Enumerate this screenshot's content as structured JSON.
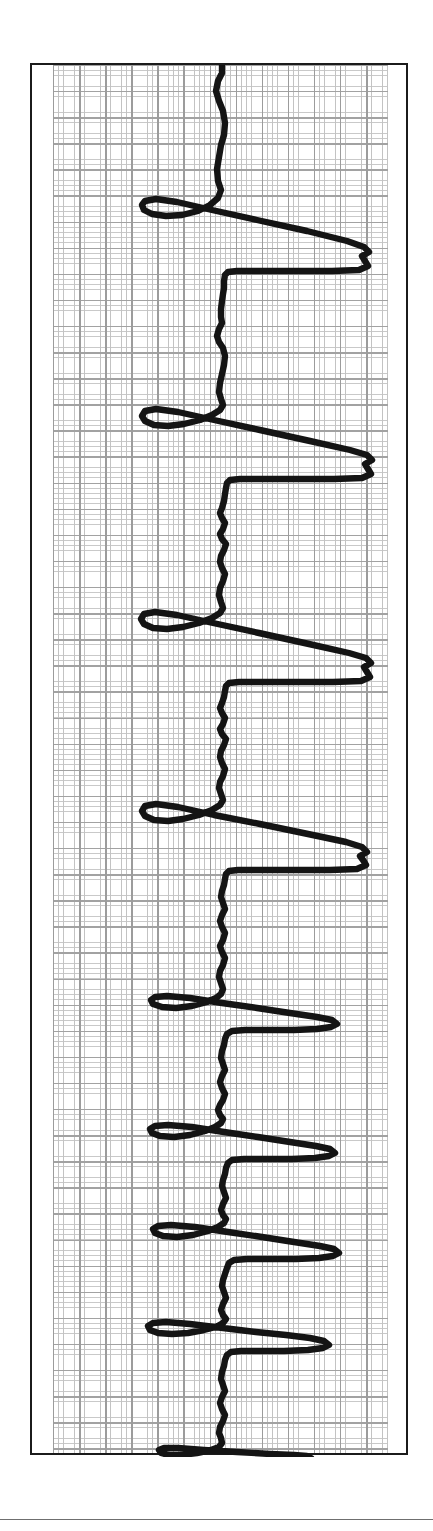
{
  "document": {
    "kind": "ecg-rhythm-strip",
    "orientation": "rotated-90-trace-runs-vertically",
    "frame_color": "#1b1b1b",
    "trace_color": "#141414",
    "grid_fine_color": "#c6c6c6",
    "grid_bold_color": "#9f9f9f",
    "paper_color": "#ffffff"
  },
  "chart_data": {
    "type": "line",
    "title": "",
    "subtitle": "",
    "xlabel": "",
    "ylabel": "",
    "grid": true,
    "legend": null,
    "annotations": [],
    "axis": {
      "time_axis": "vertical-downward",
      "amplitude_axis": "horizontal",
      "amplitude_range_units": [
        -1.55,
        2.85
      ],
      "time_range_units": [
        0,
        53.4
      ],
      "small_square_px": 5.22,
      "bold_square_every": 5,
      "baseline_amplitude": 0.0
    },
    "beats": [
      {
        "index": 1,
        "time": 3.1,
        "type": "wide-complex",
        "s_amplitude": -1.55,
        "r_amplitude": 2.82,
        "notched_peak": true
      },
      {
        "index": 2,
        "time": 9.5,
        "type": "wide-complex",
        "s_amplitude": -1.5,
        "r_amplitude": 2.85,
        "notched_peak": true
      },
      {
        "index": 3,
        "time": 16.0,
        "type": "wide-complex",
        "s_amplitude": -1.52,
        "r_amplitude": 2.78,
        "notched_peak": true
      },
      {
        "index": 4,
        "time": 22.3,
        "type": "wide-complex",
        "s_amplitude": -1.48,
        "r_amplitude": 2.8,
        "notched_peak": true
      },
      {
        "index": 5,
        "time": 26.6,
        "type": "narrow-spike",
        "s_amplitude": -1.1,
        "r_amplitude": 1.5,
        "notched_peak": false
      },
      {
        "index": 6,
        "time": 30.3,
        "type": "narrow-spike",
        "s_amplitude": -1.12,
        "r_amplitude": 1.45,
        "notched_peak": false
      },
      {
        "index": 7,
        "time": 34.0,
        "type": "narrow-spike",
        "s_amplitude": -1.15,
        "r_amplitude": 1.4,
        "notched_peak": false
      },
      {
        "index": 8,
        "time": 38.6,
        "type": "narrow-spike",
        "s_amplitude": -1.18,
        "r_amplitude": 1.52,
        "notched_peak": false
      },
      {
        "index": 9,
        "time": 42.0,
        "type": "narrow-spike",
        "s_amplitude": -1.2,
        "r_amplitude": 1.48,
        "notched_peak": false
      },
      {
        "index": 10,
        "time": 45.0,
        "type": "narrow-spike",
        "s_amplitude": -1.22,
        "r_amplitude": 1.42,
        "notched_peak": false
      },
      {
        "index": 11,
        "time": 46.8,
        "type": "narrow-spike",
        "s_amplitude": -1.05,
        "r_amplitude": 1.1,
        "notched_peak": false
      },
      {
        "index": 12,
        "time": 52.0,
        "type": "narrow-spike",
        "s_amplitude": -1.1,
        "r_amplitude": 1.05,
        "notched_peak": false
      }
    ],
    "trace_path": "M 190 0 L 190 8 L 186 16 L 184 26 L 187 36 L 191 46 L 193 58 L 192 70 L 189 80 L 187 92 L 185 104 L 186 116 L 189 125 L 186 133 L 178 140 L 166 146 L 150 150 L 134 151 L 120 149 L 112 145 L 110 140 L 113 136 L 124 134 L 145 137 L 180 145 L 225 155 L 275 166 L 315 176 L 332 182 L 337 187 L 330 191 L 333 196 L 336 201 L 327 205 L 300 206 L 260 206 L 225 206 L 205 206 L 196 207 L 193 210 L 192 216 L 192 223 L 191 229 L 190 236 L 189 244 L 189 252 L 190 258 L 187 264 L 185 271 L 187 277 L 191 283 L 193 291 L 192 300 L 190 309 L 188 318 L 187 327 L 189 334 L 191 340 L 188 345 L 180 350 L 168 355 L 152 359 L 136 361 L 122 360 L 113 356 L 110 351 L 113 346 L 124 344 L 146 347 L 182 355 L 228 365 L 278 376 L 318 385 L 335 390 L 340 395 L 333 399 L 336 404 L 339 409 L 330 413 L 302 414 L 262 414 L 228 414 L 208 414 L 198 415 L 195 418 L 194 423 L 193 429 L 192 436 L 190 443 L 188 448 L 190 453 L 193 458 L 191 464 L 188 469 L 190 474 L 194 479 L 192 485 L 189 491 L 188 497 L 190 503 L 193 509 L 191 516 L 188 523 L 187 530 L 189 537 L 191 543 L 188 548 L 180 553 L 167 558 L 151 562 L 135 564 L 121 563 L 112 559 L 109 554 L 112 549 L 123 547 L 145 550 L 181 558 L 227 568 L 277 579 L 317 588 L 334 593 L 339 598 L 332 602 L 335 607 L 338 612 L 329 616 L 301 617 L 261 617 L 227 617 L 207 617 L 197 618 L 194 621 L 193 626 L 192 632 L 190 638 L 188 643 L 190 648 L 193 653 L 191 659 L 188 664 L 190 669 L 194 674 L 192 680 L 189 686 L 188 692 L 190 698 L 193 704 L 191 711 L 188 717 L 187 723 L 189 729 L 191 735 L 188 740 L 180 745 L 167 750 L 151 754 L 136 756 L 122 755 L 113 751 L 110 746 L 113 741 L 124 739 L 146 742 L 182 750 L 228 759 L 276 769 L 314 777 L 330 782 L 335 787 L 328 791 L 331 795 L 334 800 L 325 804 L 298 805 L 259 805 L 226 805 L 206 805 L 197 806 L 194 809 L 193 814 L 192 820 L 190 826 L 189 832 L 191 838 L 193 844 L 190 850 L 188 856 L 190 862 L 193 868 L 191 875 L 188 881 L 190 887 L 193 893 L 191 900 L 188 906 L 187 912 L 189 918 L 191 924 L 189 929 L 184 933 L 175 937 L 160 941 L 144 943 L 130 942 L 121 939 L 119 935 L 123 932 L 135 931 L 158 933 L 190 938 L 225 943 L 258 948 L 285 952 L 300 955 L 305 959 L 299 962 L 285 964 L 262 965 L 235 965 L 213 965 L 200 966 L 195 969 L 193 974 L 192 980 L 190 986 L 189 993 L 191 999 L 193 1005 L 190 1011 L 188 1017 L 190 1023 L 193 1029 L 191 1035 L 188 1040 L 186 1045 L 188 1050 L 191 1054 L 189 1058 L 183 1062 L 173 1066 L 158 1070 L 142 1072 L 128 1071 L 120 1068 L 118 1064 L 123 1061 L 136 1060 L 160 1062 L 192 1067 L 226 1072 L 258 1077 L 284 1081 L 298 1084 L 303 1088 L 297 1091 L 283 1093 L 260 1094 L 234 1094 L 212 1094 L 200 1095 L 196 1098 L 194 1103 L 193 1109 L 191 1115 L 190 1121 L 192 1127 L 194 1133 L 191 1139 L 189 1145 L 191 1150 L 194 1154 L 192 1158 L 186 1162 L 176 1166 L 161 1170 L 145 1172 L 131 1171 L 123 1168 L 121 1164 L 126 1161 L 139 1160 L 163 1162 L 196 1167 L 230 1172 L 262 1177 L 288 1181 L 302 1184 L 307 1188 L 301 1191 L 287 1193 L 264 1194 L 238 1194 L 215 1194 L 202 1195 L 197 1198 L 195 1203 L 193 1209 L 191 1215 L 190 1221 L 192 1227 L 194 1233 L 191 1239 L 189 1245 L 191 1250 L 194 1254 L 191 1258 L 184 1262 L 172 1265 L 156 1268 L 140 1269 L 126 1268 L 118 1265 L 116 1261 L 121 1258 L 134 1257 L 158 1259 L 191 1263 L 224 1267 L 254 1270 L 278 1273 L 292 1276 L 297 1280 L 291 1283 L 276 1285 L 252 1286 L 228 1286 L 209 1286 L 199 1287 L 195 1290 L 193 1295 L 192 1301 L 190 1307 L 189 1314 L 191 1320 L 193 1326 L 190 1332 L 188 1338 L 190 1344 L 193 1350 L 191 1356 L 188 1362 L 187 1368 L 189 1373 L 190 1378 L 187 1382 L 179 1385 L 165 1388 L 150 1390 L 137 1390 L 129 1388 L 127 1385 L 132 1383 L 146 1383 L 172 1385 L 205 1387 L 238 1389 L 262 1390 L 275 1391 L 279 1393 L 273 1395 L 257 1396 L 232 1396 L 210 1396 L 197 1396 L 192 1397 L 191 1401 L 191 1408 L 191 1415 L 191 1422 L 191 1430 L 191 1438 L 191 1446 L 191 1452"
  }
}
